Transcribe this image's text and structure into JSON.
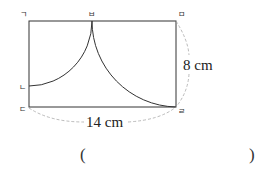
{
  "figure": {
    "type": "geometry-rectangle-with-quarter-arcs",
    "vertices": {
      "top_left": "ㄱ",
      "top_mid": "ㅂ",
      "top_right": "ㅁ",
      "left_mid": "ㄴ",
      "bottom_left": "ㄷ",
      "bottom_right": "ㄹ"
    },
    "dimensions": {
      "width_label": "14 cm",
      "height_label": "8 cm"
    },
    "colors": {
      "stroke": "#333333",
      "dashed": "#aaaaaa"
    }
  },
  "answer": {
    "open": "(",
    "close": ")"
  }
}
